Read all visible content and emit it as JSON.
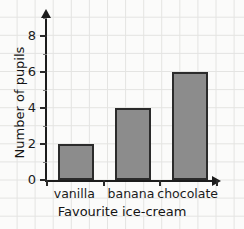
{
  "chart_data": {
    "type": "bar",
    "title": "",
    "xlabel": "Favourite ice-cream",
    "ylabel": "Number of pupils",
    "categories": [
      "vanilla",
      "banana",
      "chocolate"
    ],
    "values": [
      2,
      4,
      6
    ],
    "ylim": [
      0,
      9
    ],
    "y_major_ticks": [
      0,
      2,
      4,
      6,
      8
    ],
    "y_minor_ticks": [
      1,
      3,
      5,
      7,
      9
    ],
    "y_tick_labels": [
      "0",
      "2",
      "4",
      "6",
      "8"
    ],
    "grid": true,
    "legend": null,
    "bar_color": "#8c8c8c",
    "bar_edge_color": "#2b2b2b",
    "axis_color": "#1c1c1c",
    "grid_color": "#e3e3e1",
    "background_color": "#fbfbfa"
  }
}
